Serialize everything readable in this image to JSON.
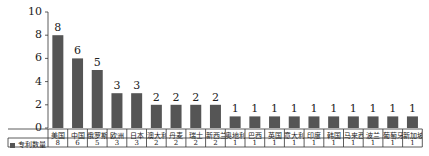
{
  "chart_data": {
    "type": "bar",
    "title": "",
    "xlabel": "",
    "ylabel": "",
    "ylim": [
      0,
      10
    ],
    "yticks": [
      0,
      2,
      4,
      6,
      8,
      10
    ],
    "grid": false,
    "legend_position": "data-table-left",
    "categories": [
      "美国",
      "中国",
      "俄罗斯",
      "欧洲",
      "日本",
      "澳大利亚",
      "丹麦",
      "瑞士",
      "新西兰",
      "奥地利",
      "巴西",
      "英国",
      "意大利",
      "印度",
      "韩国",
      "马来西亚",
      "波兰",
      "葡萄牙",
      "新加坡"
    ],
    "series": [
      {
        "name": "专利数量",
        "values": [
          8,
          6,
          5,
          3,
          3,
          2,
          2,
          2,
          2,
          1,
          1,
          1,
          1,
          1,
          1,
          1,
          1,
          1,
          1
        ]
      }
    ],
    "data_labels": true,
    "data_table": true
  },
  "colors": {
    "bar": "#555555",
    "axis": "#333333",
    "text": "#222222"
  }
}
